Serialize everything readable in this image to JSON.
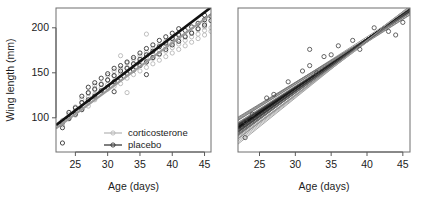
{
  "figure": {
    "type": "scientific-figure",
    "panel_count": 2,
    "background": "#ffffff"
  },
  "chart_data": [
    {
      "id": "left-panel",
      "type": "scatter",
      "title": "",
      "xlabel": "Age (days)",
      "ylabel": "Wing length (mm)",
      "xlim": [
        22,
        46
      ],
      "ylim": [
        62,
        222
      ],
      "xticks": [
        25,
        30,
        35,
        40,
        45
      ],
      "yticks": [
        100,
        150,
        200
      ],
      "grid": false,
      "legend_position": "bottom-right",
      "legend": [
        {
          "label": "corticosterone",
          "color": "#b4b4b4",
          "marker": "open-circle"
        },
        {
          "label": "placebo",
          "color": "#2b2b2b",
          "marker": "open-circle"
        }
      ],
      "series": [
        {
          "name": "corticosterone",
          "color": "#b4b4b4",
          "fit_line": {
            "intercept": -28,
            "slope": 5.28,
            "color": "#9a9a9a",
            "width": 2.2
          },
          "points": [
            [
              23,
              92
            ],
            [
              23,
              97
            ],
            [
              24,
              100
            ],
            [
              24,
              104
            ],
            [
              25,
              103
            ],
            [
              25,
              108
            ],
            [
              25,
              112
            ],
            [
              26,
              110
            ],
            [
              26,
              116
            ],
            [
              26,
              121
            ],
            [
              27,
              118
            ],
            [
              27,
              123
            ],
            [
              27,
              127
            ],
            [
              27,
              113
            ],
            [
              28,
              120
            ],
            [
              28,
              126
            ],
            [
              28,
              131
            ],
            [
              28,
              136
            ],
            [
              29,
              128
            ],
            [
              29,
              133
            ],
            [
              29,
              138
            ],
            [
              30,
              132
            ],
            [
              30,
              137
            ],
            [
              30,
              142
            ],
            [
              30,
              147
            ],
            [
              31,
              135
            ],
            [
              31,
              140
            ],
            [
              31,
              146
            ],
            [
              31,
              152
            ],
            [
              32,
              138
            ],
            [
              32,
              143
            ],
            [
              32,
              149
            ],
            [
              32,
              155
            ],
            [
              32,
              169
            ],
            [
              33,
              128
            ],
            [
              33,
              144
            ],
            [
              33,
              150
            ],
            [
              33,
              156
            ],
            [
              33,
              161
            ],
            [
              34,
              148
            ],
            [
              34,
              154
            ],
            [
              34,
              159
            ],
            [
              34,
              165
            ],
            [
              35,
              152
            ],
            [
              35,
              158
            ],
            [
              35,
              163
            ],
            [
              35,
              169
            ],
            [
              36,
              156
            ],
            [
              36,
              162
            ],
            [
              36,
              167
            ],
            [
              36,
              173
            ],
            [
              36,
              193
            ],
            [
              37,
              160
            ],
            [
              37,
              166
            ],
            [
              37,
              171
            ],
            [
              37,
              177
            ],
            [
              38,
              164
            ],
            [
              38,
              170
            ],
            [
              38,
              175
            ],
            [
              38,
              181
            ],
            [
              39,
              168
            ],
            [
              39,
              174
            ],
            [
              39,
              179
            ],
            [
              39,
              185
            ],
            [
              40,
              172
            ],
            [
              40,
              178
            ],
            [
              40,
              183
            ],
            [
              40,
              189
            ],
            [
              41,
              176
            ],
            [
              41,
              182
            ],
            [
              41,
              187
            ],
            [
              41,
              193
            ],
            [
              42,
              180
            ],
            [
              42,
              186
            ],
            [
              42,
              191
            ],
            [
              43,
              184
            ],
            [
              43,
              190
            ],
            [
              43,
              195
            ],
            [
              44,
              188
            ],
            [
              44,
              193
            ],
            [
              44,
              198
            ],
            [
              45,
              192
            ],
            [
              45,
              197
            ],
            [
              45,
              201
            ],
            [
              45,
              205
            ],
            [
              46,
              196
            ],
            [
              46,
              200
            ]
          ]
        },
        {
          "name": "placebo",
          "color": "#2b2b2b",
          "fit_line": {
            "intercept": -28,
            "slope": 5.45,
            "color": "#111111",
            "width": 2.6
          },
          "points": [
            [
              23,
              72
            ],
            [
              23,
              89
            ],
            [
              23,
              95
            ],
            [
              24,
              99
            ],
            [
              24,
              106
            ],
            [
              25,
              104
            ],
            [
              25,
              111
            ],
            [
              26,
              109
            ],
            [
              26,
              117
            ],
            [
              26,
              124
            ],
            [
              27,
              120
            ],
            [
              27,
              128
            ],
            [
              27,
              134
            ],
            [
              28,
              124
            ],
            [
              28,
              132
            ],
            [
              28,
              139
            ],
            [
              29,
              130
            ],
            [
              29,
              137
            ],
            [
              29,
              144
            ],
            [
              30,
              134
            ],
            [
              30,
              142
            ],
            [
              30,
              149
            ],
            [
              31,
              140
            ],
            [
              31,
              147
            ],
            [
              31,
              155
            ],
            [
              31,
              129
            ],
            [
              32,
              144
            ],
            [
              32,
              152
            ],
            [
              32,
              158
            ],
            [
              33,
              149
            ],
            [
              33,
              155
            ],
            [
              33,
              162
            ],
            [
              34,
              153
            ],
            [
              34,
              160
            ],
            [
              34,
              167
            ],
            [
              35,
              158
            ],
            [
              35,
              165
            ],
            [
              35,
              172
            ],
            [
              36,
              162
            ],
            [
              36,
              170
            ],
            [
              36,
              177
            ],
            [
              36,
              148
            ],
            [
              37,
              167
            ],
            [
              37,
              174
            ],
            [
              37,
              181
            ],
            [
              38,
              171
            ],
            [
              38,
              179
            ],
            [
              38,
              186
            ],
            [
              39,
              176
            ],
            [
              39,
              183
            ],
            [
              39,
              190
            ],
            [
              40,
              181
            ],
            [
              40,
              188
            ],
            [
              40,
              194
            ],
            [
              41,
              185
            ],
            [
              41,
              192
            ],
            [
              41,
              199
            ],
            [
              42,
              190
            ],
            [
              42,
              197
            ],
            [
              43,
              194
            ],
            [
              43,
              201
            ],
            [
              44,
              199
            ],
            [
              44,
              205
            ],
            [
              45,
              203
            ],
            [
              45,
              209
            ],
            [
              45,
              214
            ],
            [
              46,
              208
            ],
            [
              46,
              213
            ]
          ]
        }
      ]
    },
    {
      "id": "right-panel",
      "type": "line",
      "title": "",
      "xlabel": "Age (days)",
      "ylabel": "",
      "xlim": [
        22,
        46
      ],
      "ylim": [
        62,
        222
      ],
      "xticks": [
        25,
        30,
        35,
        40,
        45
      ],
      "yticks": [],
      "grid": false,
      "legend_position": "none",
      "description": "individual subject regression lines",
      "line_count": 48,
      "sparse_points": [
        [
          23,
          96
        ],
        [
          23,
          78
        ],
        [
          24,
          104
        ],
        [
          26,
          122
        ],
        [
          27,
          126
        ],
        [
          29,
          140
        ],
        [
          31,
          152
        ],
        [
          32,
          158
        ],
        [
          32,
          176
        ],
        [
          33,
          150
        ],
        [
          34,
          168
        ],
        [
          35,
          170
        ],
        [
          36,
          180
        ],
        [
          38,
          186
        ],
        [
          39,
          176
        ],
        [
          41,
          200
        ],
        [
          43,
          196
        ],
        [
          44,
          192
        ],
        [
          45,
          206
        ]
      ],
      "lines": [
        {
          "intercept": -34,
          "slope": 5.5,
          "color": "#888888"
        },
        {
          "intercept": -18,
          "slope": 5.05,
          "color": "#777777"
        },
        {
          "intercept": -44,
          "slope": 5.8,
          "color": "#999999"
        },
        {
          "intercept": -26,
          "slope": 5.35,
          "color": "#444444"
        },
        {
          "intercept": -10,
          "slope": 4.95,
          "color": "#aaaaaa"
        },
        {
          "intercept": -52,
          "slope": 6.0,
          "color": "#666666"
        },
        {
          "intercept": -30,
          "slope": 5.45,
          "color": "#222222"
        },
        {
          "intercept": -22,
          "slope": 5.2,
          "color": "#333333"
        },
        {
          "intercept": -40,
          "slope": 5.65,
          "color": "#555555"
        },
        {
          "intercept": -14,
          "slope": 5.1,
          "color": "#8c8c8c"
        },
        {
          "intercept": -48,
          "slope": 5.9,
          "color": "#b0b0b0"
        },
        {
          "intercept": -28,
          "slope": 5.4,
          "color": "#1a1a1a"
        },
        {
          "intercept": -36,
          "slope": 5.55,
          "color": "#3a3a3a"
        },
        {
          "intercept": -20,
          "slope": 5.15,
          "color": "#5e5e5e"
        },
        {
          "intercept": -58,
          "slope": 6.1,
          "color": "#9e9e9e"
        },
        {
          "intercept": -6,
          "slope": 4.85,
          "color": "#707070"
        },
        {
          "intercept": -32,
          "slope": 5.48,
          "color": "#161616"
        },
        {
          "intercept": -24,
          "slope": 5.28,
          "color": "#262626"
        },
        {
          "intercept": -42,
          "slope": 5.72,
          "color": "#4a4a4a"
        },
        {
          "intercept": -16,
          "slope": 5.02,
          "color": "#7e7e7e"
        },
        {
          "intercept": -62,
          "slope": 6.2,
          "color": "#a6a6a6"
        },
        {
          "intercept": -29,
          "slope": 5.42,
          "color": "#0f0f0f"
        },
        {
          "intercept": -38,
          "slope": 5.6,
          "color": "#2e2e2e"
        },
        {
          "intercept": -12,
          "slope": 4.98,
          "color": "#868686"
        },
        {
          "intercept": -46,
          "slope": 5.78,
          "color": "#626262"
        },
        {
          "intercept": -31,
          "slope": 5.46,
          "color": "#141414"
        },
        {
          "intercept": -25,
          "slope": 5.3,
          "color": "#3e3e3e"
        },
        {
          "intercept": -54,
          "slope": 5.95,
          "color": "#949494"
        },
        {
          "intercept": -19,
          "slope": 5.12,
          "color": "#6a6a6a"
        },
        {
          "intercept": -33,
          "slope": 5.52,
          "color": "#1f1f1f"
        },
        {
          "intercept": -27,
          "slope": 5.36,
          "color": "#2a2a2a"
        },
        {
          "intercept": -50,
          "slope": 5.85,
          "color": "#a2a2a2"
        },
        {
          "intercept": -8,
          "slope": 4.9,
          "color": "#7a7a7a"
        },
        {
          "intercept": -35,
          "slope": 5.56,
          "color": "#181818"
        },
        {
          "intercept": -21,
          "slope": 5.18,
          "color": "#4e4e4e"
        },
        {
          "intercept": -56,
          "slope": 6.05,
          "color": "#8e8e8e"
        },
        {
          "intercept": -30,
          "slope": 5.44,
          "color": "#0c0c0c"
        },
        {
          "intercept": -23,
          "slope": 5.24,
          "color": "#363636"
        },
        {
          "intercept": -43,
          "slope": 5.7,
          "color": "#5a5a5a"
        },
        {
          "intercept": -17,
          "slope": 5.08,
          "color": "#828282"
        },
        {
          "intercept": -66,
          "slope": 6.3,
          "color": "#b6b6b6"
        },
        {
          "intercept": -32,
          "slope": 5.5,
          "color": "#121212"
        },
        {
          "intercept": -26,
          "slope": 5.32,
          "color": "#303030"
        },
        {
          "intercept": -39,
          "slope": 5.62,
          "color": "#464646"
        },
        {
          "intercept": -13,
          "slope": 5.0,
          "color": "#767676"
        },
        {
          "intercept": -47,
          "slope": 5.82,
          "color": "#6e6e6e"
        },
        {
          "intercept": -34,
          "slope": 5.54,
          "color": "#202020"
        },
        {
          "intercept": -70,
          "slope": 6.4,
          "color": "#9a9a9a"
        }
      ]
    }
  ]
}
